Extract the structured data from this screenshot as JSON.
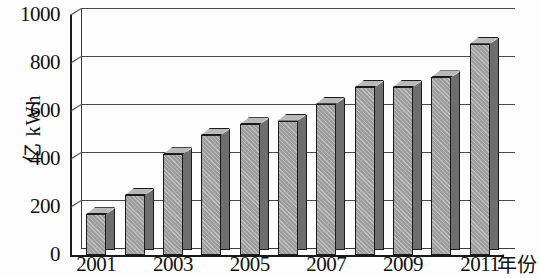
{
  "chart_data": {
    "type": "bar",
    "title": "",
    "xlabel": "年份",
    "ylabel": "亿 kWh",
    "ylim": [
      0,
      1000
    ],
    "ytick_values": [
      1000,
      800,
      600,
      400,
      200,
      0
    ],
    "ytick_labels": [
      "1000",
      "800",
      "600",
      "400",
      "200",
      "0"
    ],
    "grid": true,
    "legend": "none",
    "categories": [
      "2001",
      "2002",
      "2003",
      "2004",
      "2005",
      "2006",
      "2007",
      "2008",
      "2009",
      "2010",
      "2011"
    ],
    "xtick_labels_shown": [
      "2001",
      "2003",
      "2005",
      "2007",
      "2009",
      "2011"
    ],
    "values": [
      170,
      250,
      420,
      500,
      545,
      560,
      630,
      700,
      700,
      740,
      880
    ],
    "series": [
      {
        "name": "发电量",
        "values": [
          170,
          250,
          420,
          500,
          545,
          560,
          630,
          700,
          700,
          740,
          880
        ]
      }
    ],
    "bar_fill_color": "#9c9c9c",
    "bar_side_color": "#6e6e6e",
    "bar_top_color": "#b9b9b9",
    "bar_edge_color": "#1b1b1b",
    "axis_color": "#1a1a1a",
    "gridline_color": "#4a4a4a",
    "style": "3d-column"
  }
}
